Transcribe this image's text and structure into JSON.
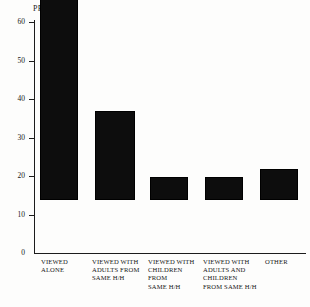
{
  "chart_data": {
    "type": "bar",
    "title": "",
    "subtitle": "",
    "xlabel": "",
    "ylabel": "PERCENT",
    "ylim": [
      0,
      60
    ],
    "yticks": [
      0,
      10,
      20,
      30,
      40,
      50,
      60
    ],
    "ytick_labels": [
      "0",
      "10",
      "20",
      "30",
      "40",
      "50",
      "60"
    ],
    "grid": false,
    "legend": null,
    "bar_color": "#0d0d0d",
    "background_color": "#fdfdfc",
    "axis_color": "#1c1c1c",
    "categories": [
      "VIEWED ALONE",
      "VIEWED WITH ADULTS FROM SAME H/H",
      "VIEWED WITH CHILDREN FROM SAME H/H",
      "VIEWED WITH ADULTS AND CHILDREN FROM SAME H/H",
      "OTHER"
    ],
    "category_label_lines": [
      [
        "VIEWED",
        "ALONE"
      ],
      [
        "VIEWED WITH",
        "ADULTS FROM",
        "SAME H/H"
      ],
      [
        "VIEWED WITH",
        "CHILDREN",
        "FROM",
        "SAME H/H"
      ],
      [
        "VIEWED WITH",
        "ADULTS AND",
        "CHILDREN",
        "FROM SAME H/H"
      ],
      [
        "OTHER"
      ]
    ],
    "values": [
      59,
      23,
      6,
      6,
      8
    ]
  },
  "axis": {
    "y_title": "PERCENT"
  }
}
